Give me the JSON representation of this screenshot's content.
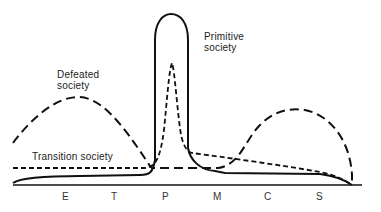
{
  "diagram": {
    "labels": {
      "primitive_line1": "Primitive",
      "primitive_line2": "society",
      "defeated_line1": "Defeated",
      "defeated_line2": "society",
      "transition": "Transition society"
    },
    "x_ticks": [
      "E",
      "T",
      "P",
      "M",
      "C",
      "S"
    ],
    "series": [
      {
        "name": "Primitive society",
        "style": "solid",
        "color": "#111111"
      },
      {
        "name": "Transition society",
        "style": "short-dashed",
        "color": "#111111"
      },
      {
        "name": "Defeated society",
        "style": "long-dashed",
        "color": "#111111"
      }
    ]
  }
}
